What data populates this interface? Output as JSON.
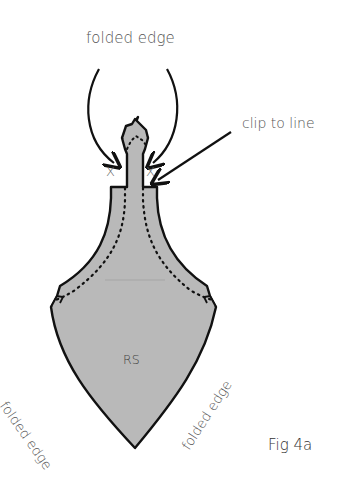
{
  "figure": {
    "caption": "Fig 4a",
    "labels": {
      "top": "folded edge",
      "clip": "clip to line",
      "side_left": "folded edge",
      "side_right": "folded edge",
      "center": "RS",
      "mark_left": "X",
      "mark_right": "X"
    },
    "colors": {
      "fill": "#b9b9b9",
      "outline": "#111111",
      "text": "#555555"
    }
  }
}
